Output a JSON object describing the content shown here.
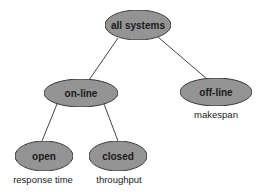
{
  "diagram": {
    "type": "tree",
    "colors": {
      "node_fill": "#9a9a9a",
      "node_stroke": "#3a3a3a",
      "edge": "#444444",
      "background": "#ffffff"
    },
    "nodes": [
      {
        "id": "all-systems",
        "label": "all systems",
        "cx": 138,
        "cy": 25,
        "rx": 33,
        "ry": 15
      },
      {
        "id": "on-line",
        "label": "on-line",
        "cx": 81,
        "cy": 93,
        "rx": 37,
        "ry": 14
      },
      {
        "id": "off-line",
        "label": "off-line",
        "cx": 216,
        "cy": 92,
        "rx": 36,
        "ry": 14
      },
      {
        "id": "open",
        "label": "open",
        "cx": 44,
        "cy": 156,
        "rx": 29,
        "ry": 15
      },
      {
        "id": "closed",
        "label": "closed",
        "cx": 118,
        "cy": 156,
        "rx": 29,
        "ry": 15
      }
    ],
    "edges": [
      {
        "from": "all-systems",
        "to": "on-line"
      },
      {
        "from": "all-systems",
        "to": "off-line"
      },
      {
        "from": "on-line",
        "to": "open"
      },
      {
        "from": "on-line",
        "to": "closed"
      }
    ],
    "annotations": [
      {
        "for": "off-line",
        "text": "makespan"
      },
      {
        "for": "open",
        "text": "response time"
      },
      {
        "for": "closed",
        "text": "throughput"
      }
    ]
  }
}
